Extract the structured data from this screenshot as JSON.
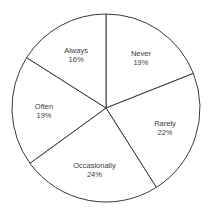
{
  "chart_data": {
    "type": "pie",
    "title": "",
    "start_angle_deg": 0,
    "direction": "clockwise",
    "categories": [
      "Never",
      "Rarely",
      "Occasionally",
      "Often",
      "Always"
    ],
    "values": [
      19,
      22,
      24,
      19,
      16
    ],
    "labels": [
      {
        "name": "Never",
        "percent": "19%"
      },
      {
        "name": "Rarely",
        "percent": "22%"
      },
      {
        "name": "Occasionally",
        "percent": "24%"
      },
      {
        "name": "Often",
        "percent": "19%"
      },
      {
        "name": "Always",
        "percent": "16%"
      }
    ],
    "colors": {
      "fill": "#ffffff",
      "stroke": "#3a3a3a",
      "label": "#404040"
    },
    "legend": "none",
    "data_labels": "inside, category name and percentage"
  }
}
